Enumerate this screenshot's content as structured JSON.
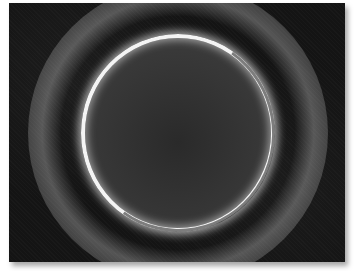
{
  "image": {
    "subject": "solar eclipse ring (annular corona)",
    "colors": {
      "background": "#141414",
      "ring": "#f4f4f4",
      "frame": "#ffffff"
    }
  }
}
